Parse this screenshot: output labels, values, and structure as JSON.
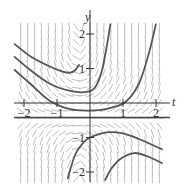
{
  "figure": {
    "type": "slope-field-with-solution-curves",
    "x_axis_label": "t",
    "y_axis_label": "y",
    "t_ticks": [
      {
        "value": -2,
        "label": "−2"
      },
      {
        "value": -1,
        "label": "−1"
      },
      {
        "value": 1,
        "label": "1"
      },
      {
        "value": 2,
        "label": "2"
      }
    ],
    "y_ticks": [
      {
        "value": 2,
        "label": "2"
      },
      {
        "value": 1,
        "label": "1"
      },
      {
        "value": -1,
        "label": "−1"
      },
      {
        "value": -2,
        "label": "−2"
      }
    ],
    "t_range": [
      -2.3,
      2.3
    ],
    "y_range": [
      -2.3,
      2.3
    ],
    "colors": {
      "axis": "#333333",
      "curve": "#555555",
      "field_mark": "#b8b8b8",
      "text": "#333333"
    },
    "equilibrium_line_y": -0.42,
    "slope_field": {
      "t_min": -2.1,
      "t_max": 2.1,
      "t_step": 0.21,
      "y_min": -2.2,
      "y_max": 2.2,
      "y_step": 0.22,
      "mark_length": 0.17
    },
    "solution_curves": [
      {
        "name": "upper-curve-a",
        "points": [
          [
            -2.3,
            1.72
          ],
          [
            -1.8,
            1.35
          ],
          [
            -1.2,
            1.05
          ],
          [
            -0.8,
            0.9
          ],
          [
            -0.6,
            0.88
          ],
          [
            -0.45,
            0.95
          ],
          [
            -0.32,
            1.12
          ]
        ]
      },
      {
        "name": "upper-curve-b",
        "points": [
          [
            -2.3,
            1.35
          ],
          [
            -1.8,
            0.95
          ],
          [
            -1.2,
            0.55
          ],
          [
            -0.6,
            0.35
          ],
          [
            -0.1,
            0.32
          ],
          [
            0.15,
            0.45
          ],
          [
            0.35,
            0.9
          ],
          [
            0.5,
            1.6
          ],
          [
            0.62,
            2.3
          ]
        ]
      },
      {
        "name": "upper-curve-c",
        "points": [
          [
            -2.3,
            0.97
          ],
          [
            -1.8,
            0.55
          ],
          [
            -1.2,
            0.05
          ],
          [
            -0.6,
            -0.18
          ],
          [
            0,
            -0.22
          ],
          [
            0.6,
            -0.15
          ],
          [
            1.1,
            0.05
          ],
          [
            1.5,
            0.6
          ],
          [
            1.8,
            1.5
          ],
          [
            2.0,
            2.3
          ]
        ]
      },
      {
        "name": "lower-curve-a",
        "points": [
          [
            -0.68,
            -2.2
          ],
          [
            -0.45,
            -1.5
          ],
          [
            -0.2,
            -1.15
          ],
          [
            0,
            -1.0
          ],
          [
            0.5,
            -0.85
          ],
          [
            1.0,
            -0.88
          ],
          [
            1.5,
            -1.05
          ],
          [
            2.2,
            -1.35
          ]
        ]
      },
      {
        "name": "lower-curve-b",
        "points": [
          [
            0.45,
            -2.25
          ],
          [
            0.65,
            -1.9
          ],
          [
            0.95,
            -1.6
          ],
          [
            1.35,
            -1.45
          ],
          [
            1.75,
            -1.55
          ],
          [
            2.2,
            -1.75
          ]
        ]
      }
    ]
  }
}
